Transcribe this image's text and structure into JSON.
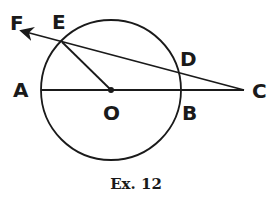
{
  "diagram": {
    "caption": "Ex. 12",
    "colors": {
      "stroke": "#1a1a1a",
      "background": "#ffffff"
    },
    "circle": {
      "center_label": "O",
      "cx": 111,
      "cy": 90,
      "r": 70
    },
    "points": {
      "A": {
        "label": "A",
        "x": 41,
        "y": 90
      },
      "B": {
        "label": "B",
        "x": 181,
        "y": 90
      },
      "C": {
        "label": "C",
        "x": 244,
        "y": 90
      },
      "D": {
        "label": "D",
        "x": 177,
        "y": 73
      },
      "E": {
        "label": "E",
        "x": 62,
        "y": 42
      },
      "F": {
        "label": "F",
        "x": 22,
        "y": 31
      },
      "O": {
        "label": "O",
        "x": 111,
        "y": 90
      }
    },
    "segments": [
      {
        "from": "A",
        "to": "C",
        "type": "line"
      },
      {
        "from": "C",
        "to": "F",
        "type": "ray",
        "passes_through": [
          "D",
          "E"
        ]
      },
      {
        "from": "E",
        "to": "O",
        "type": "radius"
      }
    ]
  }
}
